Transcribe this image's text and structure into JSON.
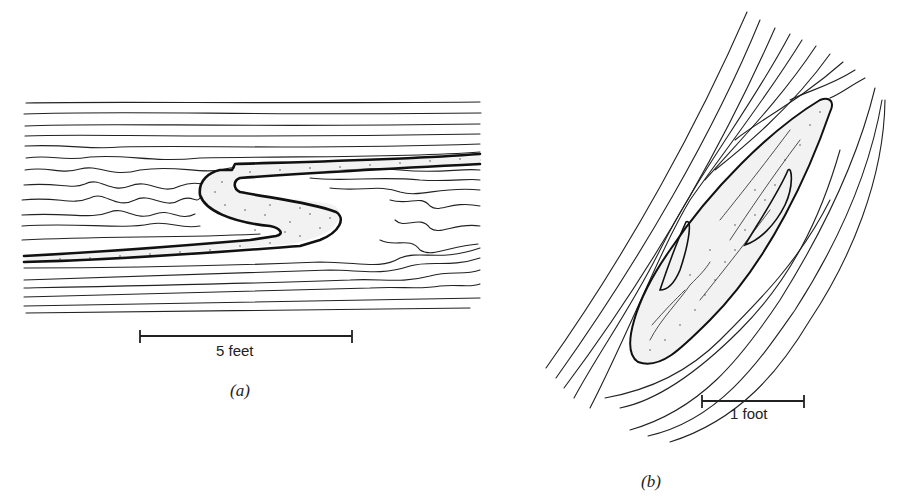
{
  "figure": {
    "panels": [
      {
        "id": "a",
        "caption": "(a)",
        "description": "Recumbent S-shaped fold in a stippled (sandy) bed within thinly laminated strata",
        "scale_bar": {
          "label": "5 feet"
        }
      },
      {
        "id": "b",
        "caption": "(b)",
        "description": "Elongate lenticular fold of a stippled bed within steeply inclined laminated strata",
        "scale_bar": {
          "label": "1 foot"
        }
      }
    ],
    "colors": {
      "ink": "#222222",
      "paper": "#ffffff"
    }
  }
}
